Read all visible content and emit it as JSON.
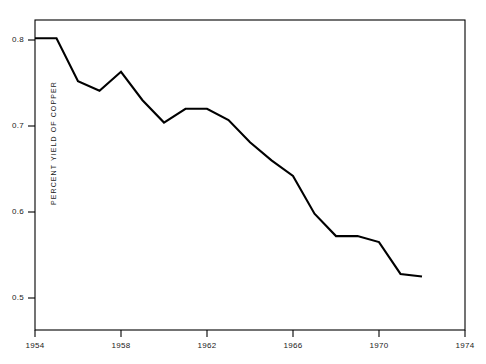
{
  "chart_data": {
    "type": "line",
    "title": "",
    "subtitle": "",
    "xlabel": "",
    "ylabel": "PERCENT YIELD OF COPPER",
    "xlim": [
      1954,
      1974
    ],
    "ylim": [
      0.47,
      0.83
    ],
    "grid": false,
    "legend": null,
    "x_ticks": [
      "1954",
      "1958",
      "1962",
      "1966",
      "1970",
      "1974"
    ],
    "x_tick_values": [
      1954,
      1958,
      1962,
      1966,
      1970,
      1974
    ],
    "y_ticks": [
      "0.8",
      "0.7",
      "0.6",
      "0.5"
    ],
    "y_tick_values": [
      0.8,
      0.7,
      0.6,
      0.5
    ],
    "line_color": "#000000",
    "frame_color": "#000000",
    "x": [
      1954,
      1955,
      1956,
      1957,
      1958,
      1959,
      1960,
      1961,
      1962,
      1963,
      1964,
      1965,
      1966,
      1967,
      1968,
      1969,
      1970,
      1971,
      1972
    ],
    "values": [
      0.802,
      0.802,
      0.752,
      0.741,
      0.763,
      0.73,
      0.704,
      0.72,
      0.72,
      0.707,
      0.681,
      0.66,
      0.642,
      0.598,
      0.572,
      0.572,
      0.565,
      0.528,
      0.525
    ],
    "series": [
      {
        "name": "Percent yield of copper",
        "values": [
          0.802,
          0.802,
          0.752,
          0.741,
          0.763,
          0.73,
          0.704,
          0.72,
          0.72,
          0.707,
          0.681,
          0.66,
          0.642,
          0.598,
          0.572,
          0.572,
          0.565,
          0.528,
          0.525
        ]
      }
    ],
    "annotations": []
  },
  "axis": {
    "y_title": "PERCENT YIELD OF COPPER",
    "y_labels": [
      "0.8",
      "0.7",
      "0.6",
      "0.5"
    ],
    "x_labels": [
      "1954",
      "1958",
      "1962",
      "1966",
      "1970",
      "1974"
    ]
  }
}
